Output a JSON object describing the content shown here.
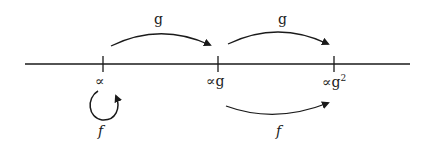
{
  "diagram": {
    "points": [
      {
        "label": "∝",
        "sup": ""
      },
      {
        "label": "∝g",
        "sup": ""
      },
      {
        "label": "∝g",
        "sup": "2"
      }
    ],
    "arrows": [
      {
        "label": "g",
        "from": "∝",
        "to": "∝g"
      },
      {
        "label": "g",
        "from": "∝g",
        "to": "∝g²"
      },
      {
        "label": "f",
        "from": "∝",
        "to": "∝",
        "kind": "loop"
      },
      {
        "label": "f",
        "from": "∝g",
        "to": "∝g²"
      }
    ],
    "colors": {
      "ink": "#1a1a1a",
      "background": "#ffffff"
    }
  }
}
